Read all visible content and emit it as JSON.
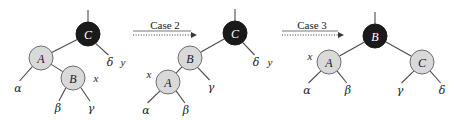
{
  "figure": {
    "colors": {
      "red_node_fill": "#d9d9d9",
      "black_node_fill": "#1a1a1a",
      "edge": "#4a4a4a",
      "text": "#1a1a1a",
      "arrow": "#3a3a3a",
      "background": "#ffffff"
    }
  },
  "transitions": [
    {
      "label": "Case 2",
      "x_center": 165,
      "label_y": 25,
      "rule_y": 31,
      "arrow_y": 35,
      "arrow_x1": 133,
      "arrow_x2": 197
    },
    {
      "label": "Case 3",
      "x_center": 312,
      "label_y": 25,
      "rule_y": 31,
      "arrow_y": 35,
      "arrow_x1": 282,
      "arrow_x2": 344
    }
  ],
  "trees": [
    {
      "name": "tree-before",
      "nodes": [
        {
          "key": "C",
          "color": "black",
          "cx": 88,
          "cy": 34,
          "r": 12
        },
        {
          "key": "A",
          "color": "red",
          "cx": 41,
          "cy": 58,
          "r": 12
        },
        {
          "key": "B",
          "color": "red",
          "cx": 73,
          "cy": 78,
          "r": 12
        }
      ],
      "parent_stub": {
        "x1": 88,
        "y1": 22,
        "x2": 88,
        "y2": 10
      },
      "edges": [
        {
          "from": "C",
          "to": "A"
        },
        {
          "from": "A",
          "to": "B"
        }
      ],
      "subtrees": [
        {
          "label": "α",
          "from": "A",
          "lx": 18,
          "ly": 88,
          "tx": 31,
          "ty": 68
        },
        {
          "label": "β",
          "from": "B",
          "lx": 58,
          "ly": 108,
          "tx": 65,
          "ty": 89
        },
        {
          "label": "γ",
          "from": "B",
          "lx": 91,
          "ly": 108,
          "tx": 82,
          "ty": 89
        },
        {
          "label": "δ",
          "from": "C",
          "lx": 110,
          "ly": 62,
          "tx": 97,
          "ty": 45
        }
      ],
      "pointers": [
        {
          "label": "x",
          "x": 96,
          "y": 78
        },
        {
          "label": "y",
          "x": 123,
          "y": 62
        }
      ]
    },
    {
      "name": "tree-after-case2",
      "nodes": [
        {
          "key": "C",
          "color": "black",
          "cx": 235,
          "cy": 33,
          "r": 12
        },
        {
          "key": "B",
          "color": "red",
          "cx": 190,
          "cy": 58,
          "r": 12
        },
        {
          "key": "A",
          "color": "red",
          "cx": 168,
          "cy": 82,
          "r": 12
        }
      ],
      "parent_stub": {
        "x1": 235,
        "y1": 21,
        "x2": 235,
        "y2": 9
      },
      "edges": [
        {
          "from": "C",
          "to": "B"
        },
        {
          "from": "B",
          "to": "A"
        }
      ],
      "subtrees": [
        {
          "label": "α",
          "from": "A",
          "lx": 146,
          "ly": 110,
          "tx": 159,
          "ty": 92
        },
        {
          "label": "β",
          "from": "A",
          "lx": 186,
          "ly": 110,
          "tx": 177,
          "ty": 92
        },
        {
          "label": "γ",
          "from": "B",
          "lx": 211,
          "ly": 87,
          "tx": 199,
          "ty": 69
        },
        {
          "label": "δ",
          "from": "C",
          "lx": 256,
          "ly": 62,
          "tx": 244,
          "ty": 44
        }
      ],
      "pointers": [
        {
          "label": "x",
          "x": 149,
          "y": 74
        },
        {
          "label": "y",
          "x": 270,
          "y": 62
        }
      ]
    },
    {
      "name": "tree-after-case3",
      "nodes": [
        {
          "key": "B",
          "color": "black",
          "cx": 375,
          "cy": 36,
          "r": 12
        },
        {
          "key": "A",
          "color": "red",
          "cx": 329,
          "cy": 62,
          "r": 12
        },
        {
          "key": "C",
          "color": "red",
          "cx": 422,
          "cy": 62,
          "r": 12
        }
      ],
      "parent_stub": {
        "x1": 375,
        "y1": 24,
        "x2": 375,
        "y2": 12
      },
      "edges": [
        {
          "from": "B",
          "to": "A"
        },
        {
          "from": "B",
          "to": "C"
        }
      ],
      "subtrees": [
        {
          "label": "α",
          "from": "A",
          "lx": 307,
          "ly": 90,
          "tx": 320,
          "ty": 72
        },
        {
          "label": "β",
          "from": "A",
          "lx": 348,
          "ly": 90,
          "tx": 338,
          "ty": 72
        },
        {
          "label": "γ",
          "from": "C",
          "lx": 400,
          "ly": 90,
          "tx": 413,
          "ty": 72
        },
        {
          "label": "δ",
          "from": "C",
          "lx": 442,
          "ly": 90,
          "tx": 431,
          "ty": 72
        }
      ],
      "pointers": [
        {
          "label": "x",
          "x": 310,
          "y": 56
        }
      ]
    }
  ]
}
